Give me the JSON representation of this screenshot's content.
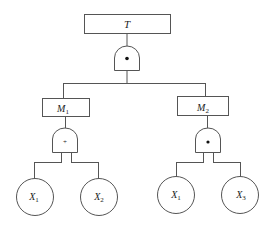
{
  "diagram": {
    "type": "fault-tree",
    "top_event": {
      "label": "T"
    },
    "top_gate": {
      "type": "AND",
      "symbol": "•"
    },
    "intermediate_events": [
      {
        "label": "M",
        "sub": "1",
        "gate": {
          "type": "OR",
          "symbol": "+"
        },
        "children": [
          {
            "label": "X",
            "sub": "1"
          },
          {
            "label": "X",
            "sub": "2"
          }
        ]
      },
      {
        "label": "M",
        "sub": "2",
        "gate": {
          "type": "AND",
          "symbol": "•"
        },
        "children": [
          {
            "label": "X",
            "sub": "1"
          },
          {
            "label": "X",
            "sub": "3"
          }
        ]
      }
    ]
  }
}
